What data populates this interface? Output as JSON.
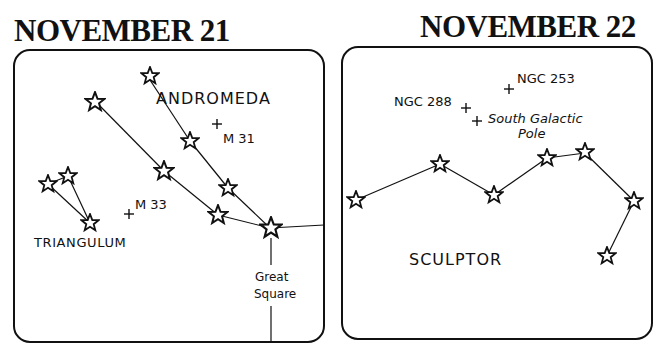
{
  "panels": [
    {
      "id": "left",
      "title": "NOVEMBER 21",
      "constellations": [
        {
          "name": "ANDROMEDA",
          "label_pos": [
            156,
            103
          ]
        },
        {
          "name": "TRIANGULUM",
          "label_pos": [
            34,
            247
          ]
        }
      ],
      "labels": {
        "andromeda": "ANDROMEDA",
        "triangulum": "TRIANGULUM",
        "m31": "M 31",
        "m33": "M 33",
        "great": "Great",
        "square": "Square"
      },
      "deep_sky_objects": [
        {
          "name": "M 31",
          "marker": [
            217,
            124
          ]
        },
        {
          "name": "M 33",
          "marker": [
            129,
            214
          ]
        }
      ],
      "annotation": "Great Square"
    },
    {
      "id": "right",
      "title": "NOVEMBER 22",
      "labels": {
        "sculptor": "SCULPTOR",
        "ngc253": "NGC 253",
        "ngc288": "NGC 288",
        "sgp1": "South Galactic",
        "sgp2": "Pole"
      },
      "deep_sky_objects": [
        {
          "name": "NGC 253",
          "marker": [
            509,
            89
          ]
        },
        {
          "name": "NGC 288",
          "marker": [
            466,
            108
          ]
        },
        {
          "name": "South Galactic Pole",
          "marker": [
            477,
            120
          ]
        }
      ]
    }
  ],
  "colors": {
    "ink": "#111111",
    "background": "#ffffff"
  }
}
